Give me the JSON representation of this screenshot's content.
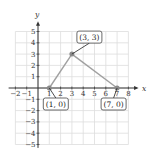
{
  "chart_data": {
    "type": "scatter",
    "title": "",
    "xlabel": "x",
    "ylabel": "y",
    "xlim": [
      -2,
      8
    ],
    "ylim": [
      -5,
      5
    ],
    "grid": true,
    "x_ticks": [
      -2,
      -1,
      1,
      2,
      3,
      4,
      5,
      6,
      7,
      8
    ],
    "y_ticks": [
      -5,
      -4,
      -3,
      -2,
      -1,
      1,
      2,
      3,
      4,
      5
    ],
    "points": [
      {
        "x": 1,
        "y": 0,
        "label": "(1, 0)"
      },
      {
        "x": 3,
        "y": 3,
        "label": "(3, 3)"
      },
      {
        "x": 7,
        "y": 0,
        "label": "(7, 0)"
      }
    ],
    "segments": [
      {
        "from": [
          1,
          0
        ],
        "to": [
          3,
          3
        ]
      },
      {
        "from": [
          3,
          3
        ],
        "to": [
          7,
          0
        ]
      }
    ],
    "colors": {
      "line": "#a0a0a0",
      "point": "#8a8a8a",
      "grid": "#dddddd",
      "axis": "#333333"
    }
  },
  "labels": {
    "x_axis": "x",
    "y_axis": "y",
    "p1": "(1, 0)",
    "p2": "(3, 3)",
    "p3": "(7, 0)"
  }
}
